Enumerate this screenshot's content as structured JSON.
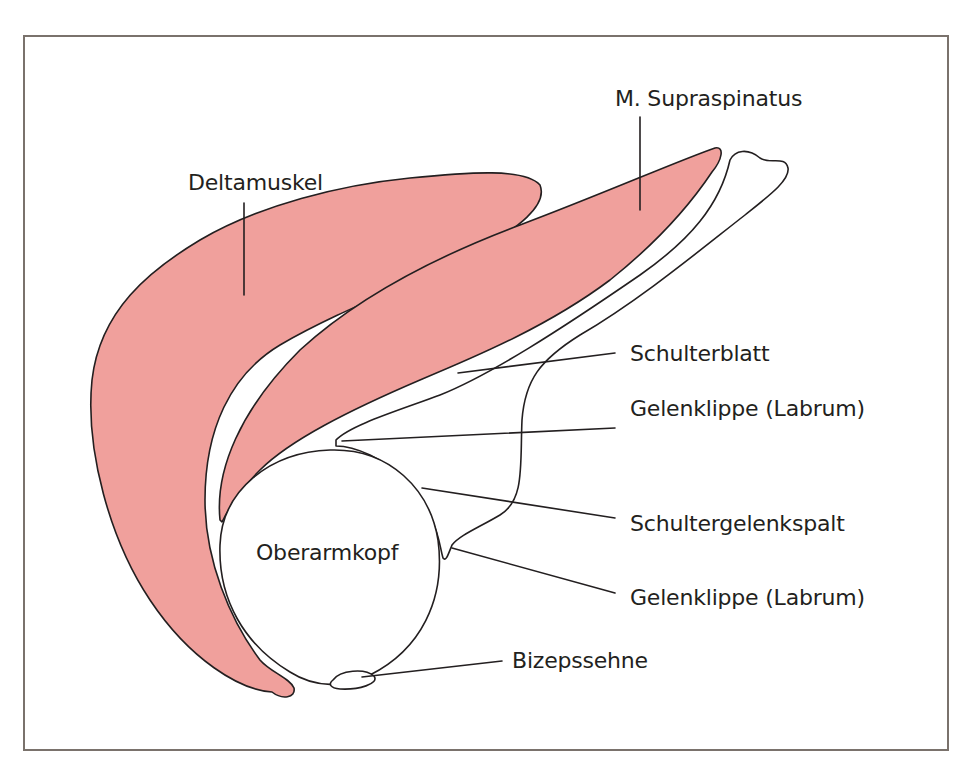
{
  "diagram": {
    "type": "anatomical-cross-section",
    "colors": {
      "muscle_fill": "#f0a09c",
      "outline": "#231f20",
      "frame": "#7a726c",
      "background": "#ffffff"
    },
    "labels": {
      "deltamuskel": "Deltamuskel",
      "supraspinatus": "M. Supraspinatus",
      "schulterblatt": "Schulterblatt",
      "labrum_upper": "Gelenklippe (Labrum)",
      "gelenkspalt": "Schultergelenkspalt",
      "labrum_lower": "Gelenklippe (Labrum)",
      "oberarmkopf": "Oberarmkopf",
      "bizepssehne": "Bizepssehne"
    }
  }
}
